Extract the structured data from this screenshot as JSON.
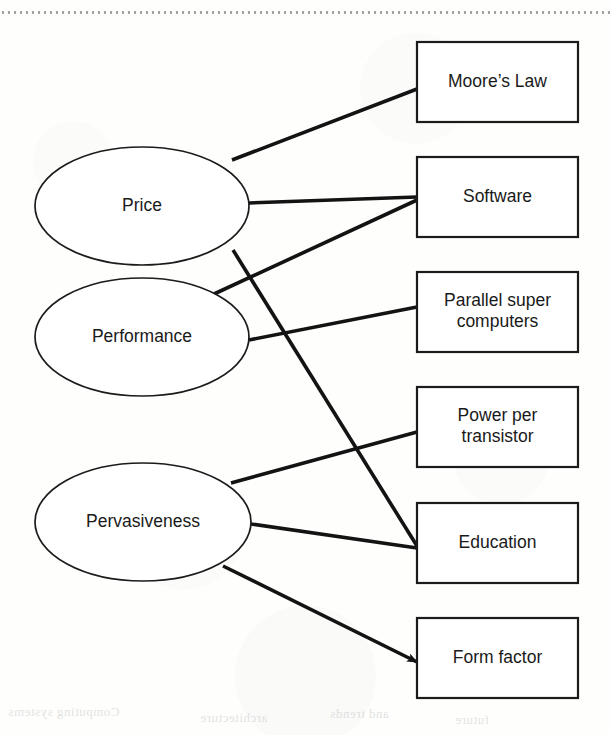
{
  "figure": {
    "type": "concept-map",
    "background_color": "#fdfdfc",
    "line_color": "#131313",
    "box_fill": "#ffffff",
    "border_color": "#1b1b1b"
  },
  "drivers": [
    {
      "id": "price",
      "label": "Price",
      "cx": 142,
      "cy": 206,
      "rx": 107,
      "ry": 59
    },
    {
      "id": "performance",
      "label": "Performance",
      "cx": 142,
      "cy": 337,
      "rx": 107,
      "ry": 59
    },
    {
      "id": "pervasiveness",
      "label": "Pervasiveness",
      "cx": 143,
      "cy": 522,
      "rx": 108,
      "ry": 59
    }
  ],
  "outcomes": [
    {
      "id": "moores-law",
      "lines": [
        "Moore’s Law"
      ],
      "x": 417,
      "y": 42,
      "w": 161,
      "h": 80
    },
    {
      "id": "software",
      "lines": [
        "Software"
      ],
      "x": 417,
      "y": 157,
      "w": 161,
      "h": 80
    },
    {
      "id": "parallel",
      "lines": [
        "Parallel super",
        "computers"
      ],
      "x": 417,
      "y": 272,
      "w": 161,
      "h": 80
    },
    {
      "id": "power",
      "lines": [
        "Power per",
        "transistor"
      ],
      "x": 417,
      "y": 387,
      "w": 161,
      "h": 80
    },
    {
      "id": "education",
      "lines": [
        "Education"
      ],
      "x": 417,
      "y": 503,
      "w": 161,
      "h": 80
    },
    {
      "id": "form-factor",
      "lines": [
        "Form factor"
      ],
      "x": 417,
      "y": 618,
      "w": 161,
      "h": 80
    }
  ],
  "edges": [
    {
      "id": "price-to-moores-law",
      "from": "price",
      "to": "moores-law",
      "arrow": false,
      "x1": 232,
      "y1": 160,
      "x2": 417,
      "y2": 89
    },
    {
      "id": "price-to-software",
      "from": "price",
      "to": "software",
      "arrow": false,
      "x1": 249,
      "y1": 203,
      "x2": 417,
      "y2": 197
    },
    {
      "id": "price-to-education",
      "from": "price",
      "to": "education",
      "arrow": false,
      "x1": 233,
      "y1": 250,
      "x2": 417,
      "y2": 546
    },
    {
      "id": "performance-to-software",
      "from": "performance",
      "to": "software",
      "arrow": false,
      "x1": 214,
      "y1": 294,
      "x2": 417,
      "y2": 200
    },
    {
      "id": "performance-to-parallel",
      "from": "performance",
      "to": "parallel",
      "arrow": false,
      "x1": 249,
      "y1": 340,
      "x2": 417,
      "y2": 307
    },
    {
      "id": "pervasiveness-to-power",
      "from": "pervasiveness",
      "to": "power",
      "arrow": false,
      "x1": 231,
      "y1": 483,
      "x2": 417,
      "y2": 432
    },
    {
      "id": "pervasiveness-to-education",
      "from": "pervasiveness",
      "to": "education",
      "arrow": false,
      "x1": 251,
      "y1": 524,
      "x2": 417,
      "y2": 548
    },
    {
      "id": "pervasiveness-to-form",
      "from": "pervasiveness",
      "to": "form-factor",
      "arrow": true,
      "x1": 223,
      "y1": 566,
      "x2": 417,
      "y2": 662
    }
  ],
  "bleed_text": [
    {
      "text": "Computing systems",
      "x": 8,
      "y": 4
    },
    {
      "text": "architecture",
      "x": 200,
      "y": 10
    },
    {
      "text": "and trends",
      "x": 330,
      "y": 6
    },
    {
      "text": "future",
      "x": 455,
      "y": 12
    }
  ]
}
